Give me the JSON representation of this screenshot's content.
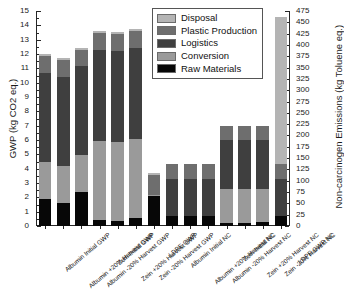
{
  "chart_data": {
    "type": "bar",
    "subtype": "stacked",
    "title": "",
    "xlabel": "",
    "ylabel": "GWP (kg CO2 eq.)",
    "ylabel_right": "Non-carcinogen Emissions (kg Toluene eq.)",
    "ylim": [
      0,
      15
    ],
    "ylim_right": [
      0,
      475
    ],
    "ytick_step": 1,
    "ytick_minor_step": 0.5,
    "ytick_step_right": 25,
    "grid": false,
    "legend_position": "top-center",
    "yticks": [
      "0",
      "1",
      "2",
      "3",
      "4",
      "5",
      "6",
      "7",
      "8",
      "9",
      "10",
      "11",
      "12",
      "13",
      "14",
      "15"
    ],
    "yticks_right": [
      "0",
      "25",
      "50",
      "75",
      "100",
      "125",
      "150",
      "175",
      "200",
      "225",
      "250",
      "275",
      "300",
      "325",
      "350",
      "375",
      "400",
      "425",
      "450",
      "475"
    ],
    "categories": [
      "Albumin Initial GWP",
      "Albumin +20% Harvest GWP",
      "Albumin -20% Harvest GWP",
      "Zein Initial GWP",
      "Zein +20% Harvest GWP",
      "Zein -20% Harvest GWP",
      "LDPE GWP",
      "Albumin Initial NC",
      "Albumin +20% Harvest NC",
      "Albumin -20% Harvest NC",
      "Zein Initial NC",
      "Zein +20% Harvest NC",
      "Zein -20% Harvest NC",
      "LDPE GWP NC"
    ],
    "series": [
      {
        "name": "Raw Materials",
        "color": "#070707",
        "values": [
          1.9,
          1.6,
          2.35,
          0.45,
          0.38,
          0.55,
          2.15,
          0.7,
          0.68,
          0.7,
          0.2,
          0.18,
          0.25,
          0.7
        ]
      },
      {
        "name": "Conversion",
        "color": "#9a9a9a",
        "values": [
          2.6,
          2.6,
          2.6,
          5.5,
          5.5,
          5.5,
          0.02,
          0.0,
          0.0,
          0.0,
          2.4,
          2.42,
          2.35,
          0.0
        ]
      },
      {
        "name": "Logistics",
        "color": "#3f3f3f",
        "values": [
          6.2,
          6.2,
          6.2,
          6.3,
          6.3,
          6.35,
          0.0,
          2.6,
          2.62,
          2.6,
          3.4,
          3.4,
          3.4,
          2.6
        ]
      },
      {
        "name": "Plastic Production",
        "color": "#6e6e6e",
        "values": [
          1.15,
          1.15,
          1.15,
          1.2,
          1.22,
          1.18,
          1.4,
          1.05,
          1.05,
          1.05,
          0.95,
          0.95,
          1.0,
          1.0
        ]
      },
      {
        "name": "Disposal",
        "color": "#b4b4b4",
        "values": [
          0.15,
          0.15,
          0.15,
          0.15,
          0.15,
          0.15,
          0.15,
          0.0,
          0.0,
          0.0,
          0.0,
          0.0,
          0.0,
          10.3
        ]
      }
    ],
    "bar_totals": [
      12.0,
      11.7,
      12.45,
      13.6,
      13.53,
      13.73,
      3.72,
      4.35,
      4.35,
      4.35,
      6.95,
      6.95,
      7.0,
      14.6
    ]
  },
  "legend": {
    "items": [
      {
        "label": "Disposal",
        "color": "#b4b4b4"
      },
      {
        "label": "Plastic Production",
        "color": "#6e6e6e"
      },
      {
        "label": "Logistics",
        "color": "#3f3f3f"
      },
      {
        "label": "Conversion",
        "color": "#9a9a9a"
      },
      {
        "label": "Raw Materials",
        "color": "#070707"
      }
    ]
  }
}
